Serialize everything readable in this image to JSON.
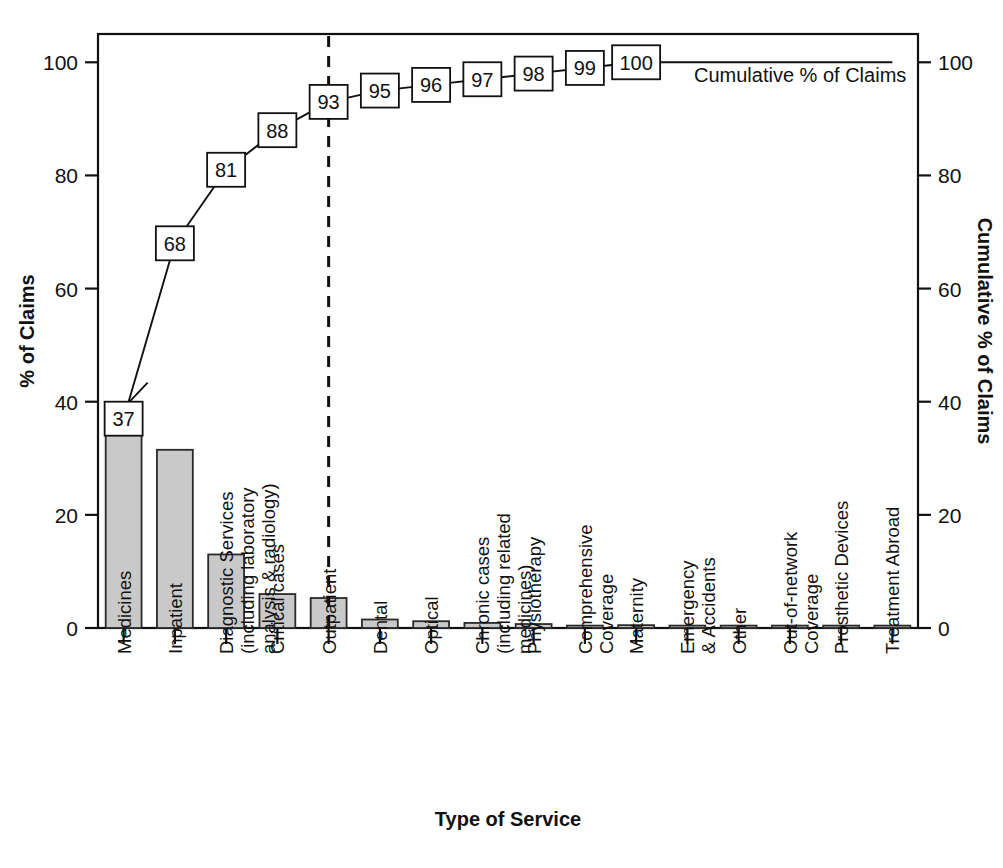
{
  "chart_data": {
    "type": "bar",
    "title": "",
    "subtitle": "",
    "xlabel": "Type of Service",
    "ylabel": "% of Claims",
    "y2label": "Cumulative % of Claims",
    "ylim": [
      0,
      105
    ],
    "y2lim": [
      0,
      105
    ],
    "ytick_labels": [
      "0",
      "20",
      "40",
      "60",
      "80",
      "100"
    ],
    "ytick_values": [
      0,
      20,
      40,
      60,
      80,
      100
    ],
    "y2tick_labels": [
      "0",
      "20",
      "40",
      "60",
      "80",
      "100"
    ],
    "y2tick_values": [
      0,
      20,
      40,
      60,
      80,
      100
    ],
    "grid": false,
    "legend_position": "top-right",
    "legend_entries": [
      "Cumulative % of Claims"
    ],
    "categories": [
      "Medicines",
      "Inpatient",
      "Diagnostic Services (including laboratory analysis & radiology)",
      "Critical cases",
      "Outpatient",
      "Dental",
      "Optical",
      "Chronic cases (including related medicines)",
      "Physiotherapy",
      "Comprehensive Coverage",
      "Maternity",
      "Emergency & Accidents",
      "Other",
      "Out-of-network Coverage",
      "Prosthetic Devices",
      "Treatment Abroad"
    ],
    "category_lines": [
      [
        "Medicines"
      ],
      [
        "Inpatient"
      ],
      [
        "Diagnostic Services",
        "(including laboratory",
        "analysis & radiology)"
      ],
      [
        "Critical cases"
      ],
      [
        "Outpatient"
      ],
      [
        "Dental"
      ],
      [
        "Optical"
      ],
      [
        "Chronic cases",
        "(including related",
        "medicines)"
      ],
      [
        "Physiotherapy"
      ],
      [
        "Comprehensive",
        "Coverage"
      ],
      [
        "Maternity"
      ],
      [
        "Emergency",
        "& Accidents"
      ],
      [
        "Other"
      ],
      [
        "Out-of-network",
        "Coverage"
      ],
      [
        "Prosthetic Devices"
      ],
      [
        "Treatment Abroad"
      ]
    ],
    "series": [
      {
        "name": "% of Claims",
        "type": "bar",
        "values": [
          36.5,
          31.5,
          13.0,
          6.0,
          5.3,
          1.5,
          1.2,
          0.9,
          0.7,
          0.35,
          0.5,
          0.2,
          0.15,
          0.1,
          0.08,
          0.05
        ]
      },
      {
        "name": "Cumulative % of Claims",
        "type": "line",
        "values": [
          37,
          68,
          81,
          88,
          93,
          95,
          96,
          97,
          98,
          99,
          100,
          100,
          100,
          100,
          100,
          100
        ],
        "labelled_points": [
          {
            "index": 0,
            "label": "37"
          },
          {
            "index": 1,
            "label": "68"
          },
          {
            "index": 2,
            "label": "81"
          },
          {
            "index": 3,
            "label": "88"
          },
          {
            "index": 4,
            "label": "93"
          },
          {
            "index": 5,
            "label": "95"
          },
          {
            "index": 6,
            "label": "96"
          },
          {
            "index": 7,
            "label": "97"
          },
          {
            "index": 8,
            "label": "98"
          },
          {
            "index": 9,
            "label": "99"
          },
          {
            "index": 10,
            "label": "100"
          }
        ]
      }
    ],
    "annotations": [
      {
        "name": "vital-few-divider",
        "type": "vertical-dashed-line",
        "at_category": "Outpatient",
        "at_index": 4
      }
    ],
    "colors": {
      "bar_fill": "#c9c9c9",
      "bar_edge": "#2a2a2a",
      "line": "#111111",
      "axis": "#111111",
      "marker_fill": "#ffffff",
      "background": "#ffffff"
    }
  }
}
